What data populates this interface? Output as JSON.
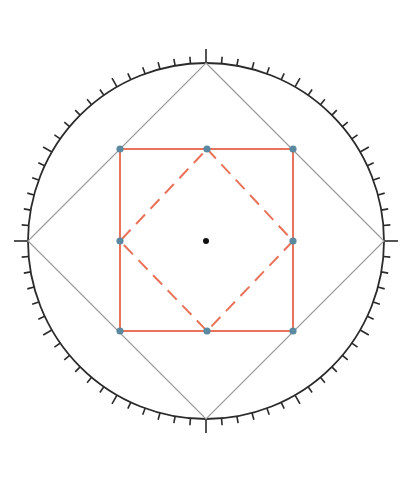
{
  "diagram": {
    "colors": {
      "circle": "#2a2a2a",
      "outer_square": "#9a9a9a",
      "inner_square": "#e8735a",
      "dashed_diamond": "#e8735a",
      "vertex_dots": "#5b8aa0",
      "center_dot": "#111111",
      "background": "#ffffff"
    },
    "circle": {
      "cx": 206,
      "cy": 241,
      "r": 178
    },
    "ticks": {
      "count": 72,
      "step_deg": 5,
      "minor_len": 7,
      "major_every": 6,
      "major_len": 10,
      "cardinal_len": 14
    },
    "outer_square_points": [
      [
        206,
        63
      ],
      [
        384,
        241
      ],
      [
        206,
        419
      ],
      [
        28,
        241
      ]
    ],
    "inner_square": {
      "x": 120,
      "y": 149,
      "size": 173
    },
    "dashed_diamond_points": [
      [
        207,
        149
      ],
      [
        293,
        241
      ],
      [
        207,
        331
      ],
      [
        120,
        241
      ]
    ],
    "dots": [
      {
        "x": 120,
        "y": 149
      },
      {
        "x": 207,
        "y": 149
      },
      {
        "x": 293,
        "y": 149
      },
      {
        "x": 120,
        "y": 241
      },
      {
        "x": 293,
        "y": 241
      },
      {
        "x": 120,
        "y": 331
      },
      {
        "x": 207,
        "y": 331
      },
      {
        "x": 293,
        "y": 331
      }
    ],
    "center": {
      "x": 206,
      "y": 241
    }
  }
}
